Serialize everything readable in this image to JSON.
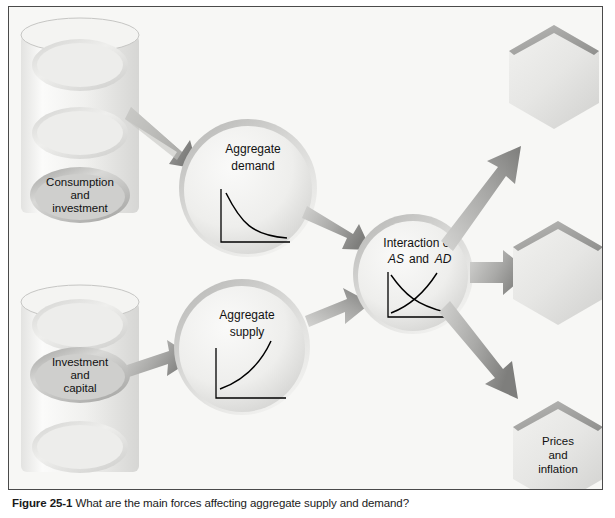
{
  "figure": {
    "caption_label": "Figure 25-1",
    "caption_text": "What are the main forces affecting aggregate supply and demand?"
  },
  "inputs": [
    {
      "id": "consumption-investment",
      "line1": "Consumption",
      "line2": "and",
      "line3": "investment"
    },
    {
      "id": "investment-capital",
      "line1": "Investment",
      "line2": "and",
      "line3": "capital"
    }
  ],
  "processes": [
    {
      "id": "aggregate-demand",
      "line1": "Aggregate",
      "line2": "demand",
      "curve": "downward-sloping"
    },
    {
      "id": "aggregate-supply",
      "line1": "Aggregate",
      "line2": "supply",
      "curve": "upward-sloping"
    },
    {
      "id": "interaction-as-ad",
      "line1": "Interaction of",
      "line2_a": "AS",
      "line2_b": "and",
      "line2_c": "AD",
      "curve": "crossing-as-ad"
    }
  ],
  "outputs": [
    {
      "id": "output-top",
      "line1": "",
      "line2": "",
      "line3": ""
    },
    {
      "id": "output-middle",
      "line1": "",
      "line2": "",
      "line3": ""
    },
    {
      "id": "output-bottom",
      "line1": "Prices",
      "line2": "and",
      "line3": "inflation"
    }
  ],
  "colors": {
    "panel_background": "#f7f7f5",
    "panel_border": "#4a4a4a",
    "shape_light": "#f2f2f0",
    "shape_mid": "#d8d8d6",
    "shape_dark": "#9e9e9c",
    "arrow_light": "#cfcfcd",
    "arrow_dark": "#828280",
    "text": "#111111",
    "curve_stroke": "#000000"
  }
}
